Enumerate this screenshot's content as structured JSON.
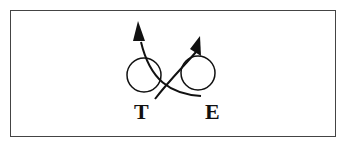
{
  "diagram": {
    "labels": {
      "left": "T",
      "right": "E"
    },
    "elements": [
      {
        "type": "circle",
        "name": "left-circle"
      },
      {
        "type": "circle",
        "name": "right-circle"
      },
      {
        "type": "arrow",
        "name": "arrow-from-E-to-upper-left",
        "direction": "up-left"
      },
      {
        "type": "arrow",
        "name": "arrow-from-T-to-upper-right",
        "direction": "up-right"
      }
    ],
    "colors": {
      "stroke": "#111111",
      "frame": "#444444",
      "background": "#ffffff"
    }
  }
}
